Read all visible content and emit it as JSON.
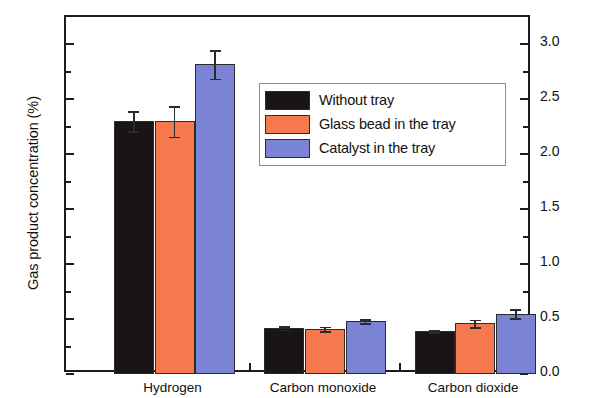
{
  "chart_data": {
    "type": "bar",
    "title": "",
    "xlabel": "",
    "ylabel": "Gas product concentration (%)",
    "categories": [
      "Hydrogen",
      "Carbon monoxide",
      "Carbon dioxide"
    ],
    "ylim": [
      0.0,
      3.25
    ],
    "yticks": [
      "0.0",
      "0.5",
      "1.0",
      "1.5",
      "2.0",
      "2.5",
      "3.0"
    ],
    "ytick_values": [
      0.0,
      0.5,
      1.0,
      1.5,
      2.0,
      2.5,
      3.0
    ],
    "right_axis": {
      "mirrored": true,
      "ticks": [
        "0.0",
        "0.5",
        "1.0",
        "1.5",
        "2.0",
        "2.5",
        "3.0"
      ]
    },
    "grid": false,
    "legend_position": "upper center",
    "series": [
      {
        "name": "Without tray",
        "color": "#1a1416",
        "values": [
          2.3,
          0.42,
          0.39
        ],
        "errors": [
          0.09,
          0.015,
          0.012
        ]
      },
      {
        "name": "Glass bead in the tray",
        "color": "#f4794f",
        "values": [
          2.3,
          0.41,
          0.46
        ],
        "errors": [
          0.14,
          0.02,
          0.035
        ]
      },
      {
        "name": "Catalyst in the tray",
        "color": "#7b84d4",
        "values": [
          2.82,
          0.48,
          0.55
        ],
        "errors": [
          0.13,
          0.02,
          0.04
        ]
      }
    ]
  },
  "legend": {
    "items": [
      {
        "label": "Without tray",
        "color": "#1a1416"
      },
      {
        "label": "Glass bead in the tray",
        "color": "#f4794f"
      },
      {
        "label": "Catalyst in the tray",
        "color": "#7b84d4"
      }
    ]
  },
  "axes": {
    "y_title": "Gas product concentration (%)"
  }
}
